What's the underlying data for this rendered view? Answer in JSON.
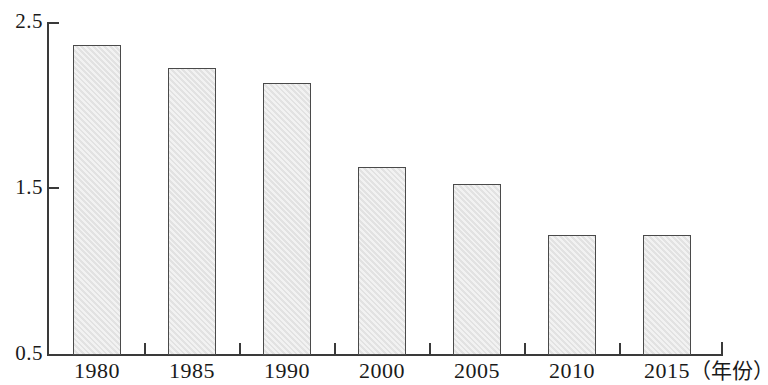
{
  "chart_data": {
    "type": "bar",
    "title": "",
    "subtitle": "",
    "xlabel": "（年份）",
    "ylabel": "",
    "categories": [
      "1980",
      "1985",
      "1990",
      "2000",
      "2005",
      "2010",
      "2015"
    ],
    "values": [
      2.37,
      2.23,
      2.14,
      1.63,
      1.53,
      1.22,
      1.22
    ],
    "ylim": [
      0.5,
      2.5
    ],
    "y_ticks": [
      "2.5",
      "1.5",
      "0.5"
    ],
    "y_tick_values": [
      2.5,
      1.5,
      0.5
    ],
    "grid": false,
    "legend": null,
    "legend_position": "none",
    "series": [
      {
        "name": "",
        "values": [
          2.37,
          2.23,
          2.14,
          1.63,
          1.53,
          1.22,
          1.22
        ]
      }
    ],
    "bar_fill_color": "#e2e2e2",
    "bar_border_color": "#4a4a4a",
    "axis_color": "#3a3a3a",
    "background_color": "#ffffff"
  },
  "axis": {
    "x_title": "（年份）",
    "y_ticks": [
      {
        "label": "2.5",
        "value": 2.5
      },
      {
        "label": "1.5",
        "value": 1.5
      },
      {
        "label": "0.5",
        "value": 0.5
      }
    ]
  },
  "bars": [
    {
      "category": "1980",
      "value": 2.37
    },
    {
      "category": "1985",
      "value": 2.23
    },
    {
      "category": "1990",
      "value": 2.14
    },
    {
      "category": "2000",
      "value": 1.63
    },
    {
      "category": "2005",
      "value": 1.53
    },
    {
      "category": "2010",
      "value": 1.22
    },
    {
      "category": "2015",
      "value": 1.22
    }
  ]
}
